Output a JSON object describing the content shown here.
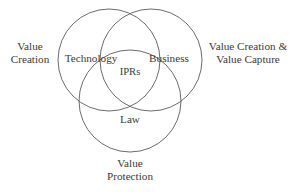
{
  "diagram": {
    "type": "venn-3-set",
    "background_color": "#ffffff",
    "stroke_color": "#5a5a5a",
    "text_color": "#3c3a38",
    "sets": [
      {
        "id": "technology",
        "label": "Technology",
        "cx": 109,
        "cy": 60,
        "r": 51
      },
      {
        "id": "business",
        "label": "Business",
        "cx": 151,
        "cy": 60,
        "r": 51
      },
      {
        "id": "law",
        "label": "Law",
        "cx": 130,
        "cy": 101,
        "r": 51
      }
    ],
    "intersection": {
      "id": "iprs",
      "label": "IPRs"
    },
    "annotations": {
      "left": {
        "line1": "Value",
        "line2": "Creation"
      },
      "right": {
        "line1": "Value Creation &",
        "line2": "Value Capture"
      },
      "bottom": {
        "line1": "Value",
        "line2": "Protection"
      }
    }
  }
}
